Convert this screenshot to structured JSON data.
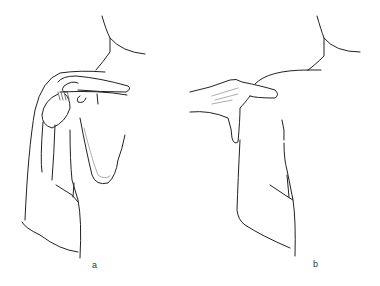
{
  "figure": {
    "type": "medical line illustration",
    "panels": [
      {
        "id": "a",
        "label": "a",
        "subject": "shoulder anatomy with scapula and rotator cuff"
      },
      {
        "id": "b",
        "label": "b",
        "subject": "hand palpating shoulder"
      }
    ]
  }
}
